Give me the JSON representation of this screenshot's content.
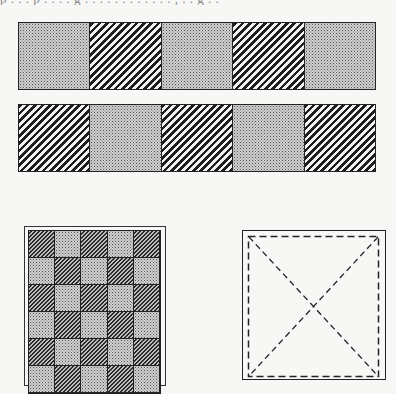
{
  "header": {
    "cut_off_text": "p . . . p . . . . g . . . . . . . . . . . . , . . g . ."
  },
  "figures": {
    "strip_top": {
      "cells": [
        "stipple",
        "hatch",
        "stipple",
        "hatch",
        "stipple"
      ]
    },
    "strip_bottom": {
      "cells": [
        "hatch",
        "stipple",
        "hatch",
        "stipple",
        "hatch"
      ]
    },
    "checkerboard": {
      "columns": 5,
      "rows_visible": 6,
      "pattern": [
        [
          "hatch-fine",
          "stipple",
          "hatch-fine",
          "stipple",
          "hatch-fine"
        ],
        [
          "stipple",
          "hatch-fine",
          "stipple",
          "hatch-fine",
          "stipple"
        ],
        [
          "hatch-fine",
          "stipple",
          "hatch-fine",
          "stipple",
          "hatch-fine"
        ],
        [
          "stipple",
          "hatch-fine",
          "stipple",
          "hatch-fine",
          "stipple"
        ],
        [
          "hatch-fine",
          "stipple",
          "hatch-fine",
          "stipple",
          "hatch-fine"
        ],
        [
          "stipple",
          "hatch-fine",
          "stipple",
          "hatch-fine",
          "stipple"
        ]
      ]
    },
    "dashed_box": {
      "style": "dashed square with diagonal X",
      "stroke": "#222222"
    }
  },
  "colors": {
    "ink": "#222222",
    "paper": "#f7f7f5",
    "stipple_bg": "#cfcfcf"
  }
}
